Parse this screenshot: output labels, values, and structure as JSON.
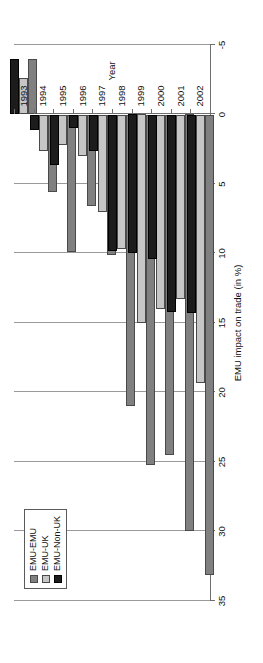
{
  "chart_data": {
    "type": "bar",
    "title": "",
    "orientation": "horizontal-rotated",
    "xlabel": "Year",
    "ylabel": "EMU impact on trade (in %)",
    "categories": [
      "1993",
      "1994",
      "1995",
      "1996",
      "1997",
      "1998",
      "1999",
      "2000",
      "2001",
      "2002"
    ],
    "tick_labels": [
      "35",
      "30",
      "25",
      "20",
      "15",
      "10",
      "5",
      "0",
      "-5"
    ],
    "tick_values": [
      35,
      30,
      25,
      20,
      15,
      10,
      5,
      0,
      -5
    ],
    "ylim": [
      -5,
      35
    ],
    "grid": true,
    "legend_position": "top-left",
    "series": [
      {
        "name": "EMU-EMU",
        "color": "#808080",
        "values": [
          -4.0,
          5.6,
          9.9,
          6.6,
          10.1,
          21.0,
          25.2,
          24.5,
          30.0,
          33.1
        ]
      },
      {
        "name": "EMU-UK",
        "color": "#c6c6c6",
        "values": [
          -2.6,
          2.6,
          2.2,
          3.0,
          7.0,
          9.7,
          15.0,
          14.0,
          13.3,
          19.3
        ]
      },
      {
        "name": "EMU-Non-UK",
        "color": "#1c1c1c",
        "values": [
          -4.0,
          1.1,
          3.6,
          1.0,
          2.6,
          9.8,
          10.0,
          10.4,
          14.2,
          14.3
        ]
      }
    ]
  },
  "legend": {
    "items": [
      {
        "label": "EMU-EMU"
      },
      {
        "label": "EMU-UK"
      },
      {
        "label": "EMU-Non-UK"
      }
    ]
  }
}
